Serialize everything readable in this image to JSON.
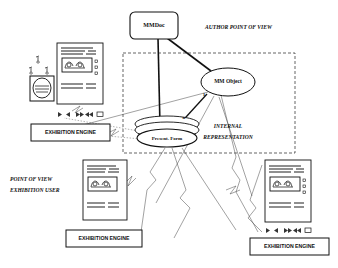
{
  "diagram": {
    "nodes": {
      "mmdoc": {
        "label": "MMDoc",
        "shape": "rounded-rectangle"
      },
      "mm_object": {
        "label": "MM Object",
        "shape": "ellipse"
      },
      "present_form": {
        "label": "Present. Form",
        "shape": "stacked-cylinder"
      }
    },
    "regions": {
      "author_pov": {
        "label": "AUTHOR POINT OF VIEW"
      },
      "internal_representation": {
        "line1": "INTERNAL",
        "line2": "REPRESENTATION"
      },
      "user_pov": {
        "line1": "POINT OF VIEW",
        "line2": "EXHIBITION USER"
      }
    },
    "engines": [
      {
        "label": "EXHIBITION ENGINE",
        "position": "left"
      },
      {
        "label": "EXHIBITION ENGINE",
        "position": "bottom-left"
      },
      {
        "label": "EXHIBITION ENGINE",
        "position": "bottom-right"
      }
    ],
    "cardinalities": {
      "one": "1",
      "many": "n"
    },
    "document_previews": [
      {
        "name": "author-document-preview",
        "text_rows": "AAAAAAAA AAAAAA AAA AAAAAA AAA",
        "has_media_controls": true,
        "has_bullets": true
      },
      {
        "name": "user-document-preview-left",
        "text_rows": "AAAAAAAA AAAAAA AAA AAAAAA AAA",
        "has_media_controls": false,
        "has_bullets": false
      },
      {
        "name": "user-document-preview-right",
        "text_rows": "AAAAAAAA AAAAAA AAA AAAAAA AAA",
        "has_media_controls": true,
        "has_bullets": true
      }
    ],
    "media_controls": {
      "play": "▶",
      "rewind": "◀",
      "fast_forward": "▶▶",
      "rewind_all": "◀◀",
      "stop": "■"
    },
    "colors": {
      "stroke": "#111111",
      "background": "#ffffff",
      "dashed_boundary": "#222222",
      "thin_connector": "#666666"
    }
  }
}
